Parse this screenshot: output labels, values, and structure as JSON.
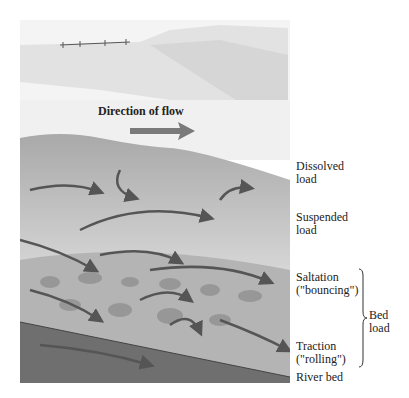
{
  "diagram": {
    "flow_label": "Direction of flow",
    "labels": [
      {
        "id": "dissolved",
        "text": "Dissolved\nload",
        "top": 160
      },
      {
        "id": "suspended",
        "text": "Suspended\nload",
        "top": 211
      },
      {
        "id": "saltation",
        "text": "Saltation\n(\"bouncing\")",
        "top": 271
      },
      {
        "id": "traction",
        "text": "Traction\n(\"rolling\")",
        "top": 340
      },
      {
        "id": "riverbed",
        "text": "River bed",
        "top": 371
      }
    ],
    "bed_load_label": "Bed\nload",
    "colors": {
      "sky": "#f2f2f2",
      "water": "#9a9a9a",
      "bed": "#6f6f6f",
      "arrow": "#555555"
    }
  }
}
